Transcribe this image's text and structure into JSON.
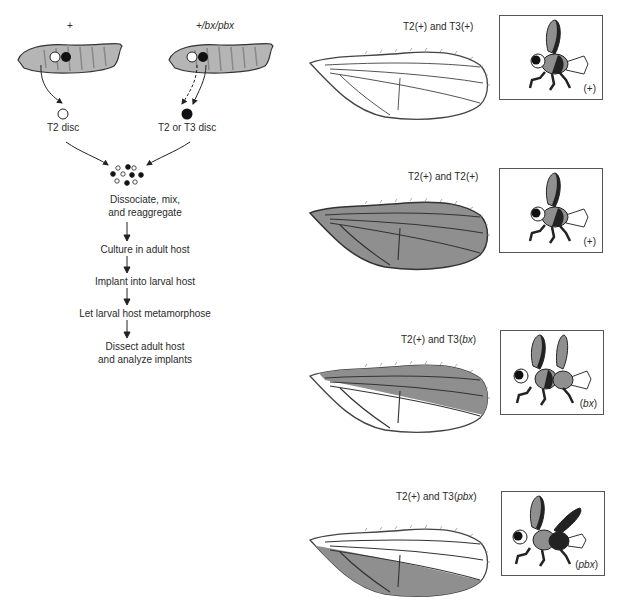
{
  "colors": {
    "wing_fill": "#8f8f8f",
    "larva_fill": "#b5b5b5",
    "outline": "#333333",
    "panel_border": "#555555"
  },
  "left": {
    "larva_wt_label": "+",
    "larva_mut_label": "+/bx/pbx",
    "disc_wt_label": "T2 disc",
    "disc_mut_label": "T2 or T3 disc",
    "steps": [
      "Dissociate, mix,",
      "and reaggregate",
      "Culture in adult host",
      "Implant into larval host",
      "Let larval host metamorphose",
      "Dissect adult host",
      "and analyze implants"
    ]
  },
  "rows": [
    {
      "title_pre": "T2(+) and T3(",
      "title_it": "+",
      "title_post": ")",
      "genotype": "(+)",
      "wing": "all-white"
    },
    {
      "title_pre": "T2(+) and T2(",
      "title_it": "+",
      "title_post": ")",
      "genotype": "(+)",
      "wing": "all-gray"
    },
    {
      "title_pre": "T2(+) and T3(",
      "title_it": "bx",
      "title_post": ")",
      "genotype_pre": "(",
      "genotype_it": "bx",
      "genotype_post": ")",
      "wing": "anterior-gray"
    },
    {
      "title_pre": "T2(+) and T3(",
      "title_it": "pbx",
      "title_post": ")",
      "genotype_pre": "(",
      "genotype_it": "pbx",
      "genotype_post": ")",
      "wing": "posterior-gray"
    }
  ]
}
